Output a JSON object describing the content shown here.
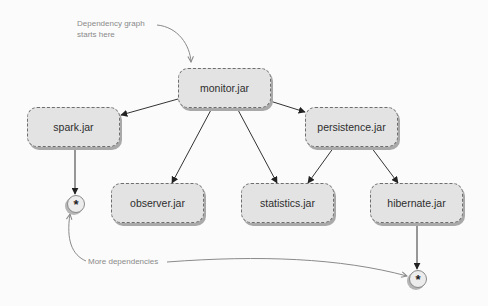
{
  "diagram": {
    "title": "Dependency graph",
    "annotations": {
      "start_note_line1": "Dependency graph",
      "start_note_line2": "starts here",
      "more_note": "More dependencies"
    },
    "nodes": [
      {
        "id": "monitor",
        "label": "monitor.jar"
      },
      {
        "id": "spark",
        "label": "spark.jar"
      },
      {
        "id": "persistence",
        "label": "persistence.jar"
      },
      {
        "id": "observer",
        "label": "observer.jar"
      },
      {
        "id": "statistics",
        "label": "statistics.jar"
      },
      {
        "id": "hibernate",
        "label": "hibernate.jar"
      }
    ],
    "more_markers": [
      {
        "attached_to": "spark",
        "glyph": "*"
      },
      {
        "attached_to": "hibernate",
        "glyph": "*"
      }
    ],
    "edges": [
      {
        "from": "monitor.jar",
        "to": "spark.jar"
      },
      {
        "from": "monitor.jar",
        "to": "persistence.jar"
      },
      {
        "from": "monitor.jar",
        "to": "observer.jar"
      },
      {
        "from": "monitor.jar",
        "to": "statistics.jar"
      },
      {
        "from": "persistence.jar",
        "to": "statistics.jar"
      },
      {
        "from": "persistence.jar",
        "to": "hibernate.jar"
      },
      {
        "from": "spark.jar",
        "to": "*"
      },
      {
        "from": "hibernate.jar",
        "to": "*"
      }
    ],
    "colors": {
      "node_fill": "#e3e3e3",
      "node_border": "#6e6e6e",
      "edge": "#333333",
      "annotation": "#8a8a8a"
    }
  }
}
